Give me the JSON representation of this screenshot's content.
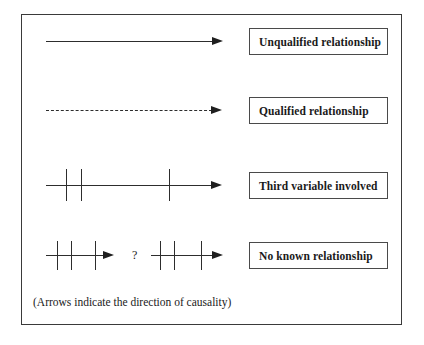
{
  "diagram": {
    "caption": "(Arrows indicate the direction of causality)",
    "frame_color": "#3a3a3a",
    "line_color": "#2d2d2d",
    "text_color": "#1a1a1a",
    "background": "#ffffff",
    "question_mark": "?",
    "rows": [
      {
        "id": "unqualified",
        "label": "Unqualified relationship",
        "symbol": "solid-arrow",
        "line_style": "solid",
        "ticks": 0,
        "segments": 1
      },
      {
        "id": "qualified",
        "label": "Qualified relationship",
        "symbol": "dashed-arrow",
        "line_style": "dashed",
        "ticks": 0,
        "segments": 1
      },
      {
        "id": "third-variable",
        "label": "Third variable involved",
        "symbol": "solid-arrow-with-three-ticks",
        "line_style": "solid",
        "ticks": 3,
        "segments": 1
      },
      {
        "id": "no-known",
        "label": "No known relationship",
        "symbol": "two-ticked-arrows-split-by-question-mark",
        "line_style": "solid",
        "ticks": 6,
        "segments": 2
      }
    ]
  }
}
